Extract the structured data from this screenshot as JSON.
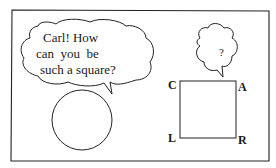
{
  "cartoon": {
    "speech_bubble": {
      "lines": [
        "Carl! How",
        "can  you  be",
        "such a square?"
      ]
    },
    "thought_bubble": {
      "text": "?"
    },
    "square_labels": {
      "top_left": "C",
      "top_right": "A",
      "bottom_left": "L",
      "bottom_right": "R"
    },
    "characters": [
      "circle",
      "square"
    ],
    "colors": {
      "ink": "#1a1a1a",
      "paper": "#ffffff"
    }
  }
}
